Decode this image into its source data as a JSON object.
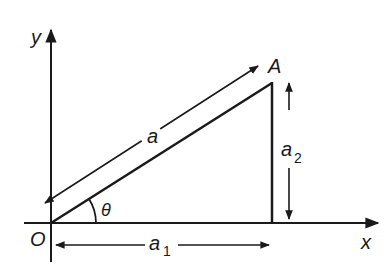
{
  "diagram": {
    "labels": {
      "y_axis": "y",
      "x_axis": "x",
      "origin": "O",
      "point": "A",
      "vector": "a",
      "angle": "θ",
      "comp1_base": "a",
      "comp1_sub": "1",
      "comp2_base": "a",
      "comp2_sub": "2"
    },
    "colors": {
      "stroke": "#1a1a1a",
      "background": "#ffffff"
    }
  }
}
